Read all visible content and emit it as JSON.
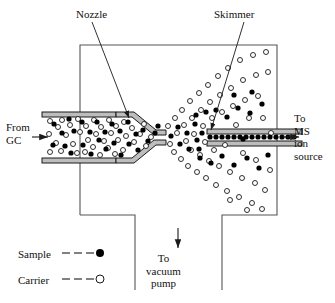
{
  "diagram": {
    "type": "schematic-cross-section"
  },
  "labels": {
    "nozzle": "Nozzle",
    "skimmer": "Skimmer",
    "from_gc": "From\nGC",
    "to_ms": "To\nMS\nion\nsource",
    "to_vacuum": "To\nvacuum\npump"
  },
  "legend": {
    "sample_label": "Sample",
    "sample_dash": "— — —",
    "carrier_label": "Carrier",
    "carrier_dash": "— — —",
    "sample_marker": "filled-circle",
    "carrier_marker": "open-circle"
  },
  "colors": {
    "line": "#1a1a1a",
    "chamber_outline": "#555555",
    "tube_wall": "#b8b8b8",
    "sample_fill": "#000000",
    "carrier_fill": "#ffffff",
    "background": "#ffffff"
  },
  "particles": {
    "sample_note": "filled circles = sample molecules",
    "carrier_note": "open circles = carrier gas molecules",
    "diameter_px": 5
  }
}
